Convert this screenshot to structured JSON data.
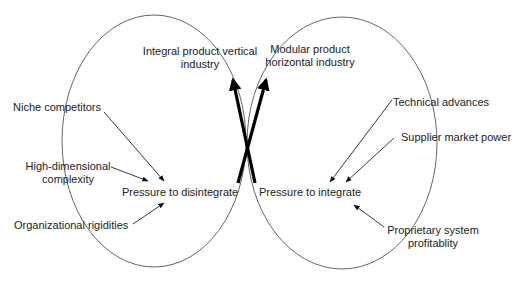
{
  "diagram": {
    "type": "two-loop causal diagram",
    "left_loop": {
      "center_label": "Pressure to disintegrate",
      "drivers": [
        "Niche competitors",
        "High-dimensional complexity",
        "Organizational rigidities"
      ]
    },
    "right_loop": {
      "center_label": "Pressure to integrate",
      "drivers": [
        "Technical advances",
        "Supplier market power",
        "Proprietary system profitablity"
      ]
    },
    "outcomes": {
      "left_top": [
        "Integral product vertical",
        "industry"
      ],
      "right_top": [
        "Modular product",
        "horizontal industry"
      ]
    }
  },
  "labels": {
    "niche": "Niche competitors",
    "highdim_1": "High-dimensional",
    "highdim_2": "complexity",
    "org": "Organizational rigidities",
    "disintegrate": "Pressure to disintegrate",
    "integral_1": "Integral product vertical",
    "integral_2": "industry",
    "modular_1": "Modular product",
    "modular_2": "horizontal industry",
    "tech": "Technical advances",
    "supplier": "Supplier market power",
    "integrate": "Pressure to integrate",
    "proprietary_1": "Proprietary system",
    "proprietary_2": "profitablity"
  },
  "colors": {
    "ink": "#222222",
    "loop_line": "#555555",
    "background": "#ffffff"
  }
}
